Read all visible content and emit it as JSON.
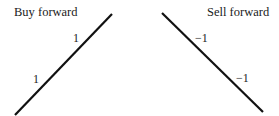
{
  "panels": [
    {
      "title": "Buy forward",
      "slope_labels": [
        "1",
        "1"
      ],
      "line": {
        "x1": 15,
        "y1": 115,
        "x2": 112,
        "y2": 14,
        "direction": "upward"
      }
    },
    {
      "title": "Sell forward",
      "slope_labels": [
        "−1",
        "−1"
      ],
      "line": {
        "x1": 162,
        "y1": 13,
        "x2": 263,
        "y2": 112,
        "direction": "downward"
      }
    }
  ],
  "colors": {
    "line": "#111111",
    "text": "#1a1a1a",
    "background": "#ffffff"
  }
}
